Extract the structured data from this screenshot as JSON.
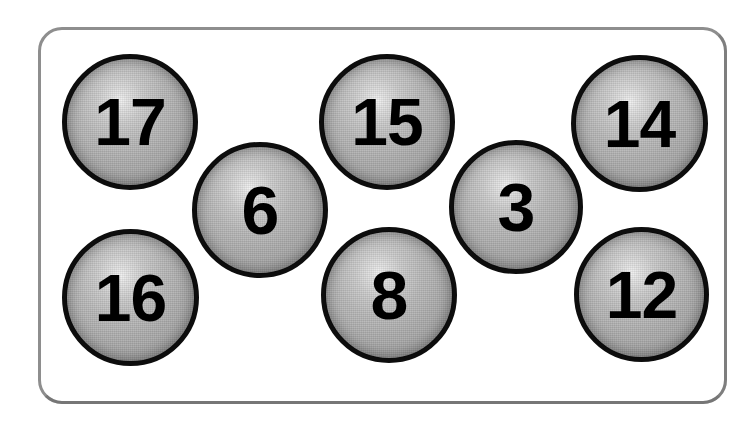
{
  "scene": {
    "width": 754,
    "height": 428,
    "background_color": "#ffffff",
    "description": "Photograph-style illustration of eight numbered lottery/bingo balls arranged inside a white rounded rectangular tray"
  },
  "tray": {
    "name": "rounded-tray",
    "border_color": "#8e8e8e",
    "fill_color": "#ffffff",
    "border_width_px": 3,
    "corner_radius_px": 24,
    "left": 38,
    "top": 27,
    "width": 683,
    "height": 371
  },
  "ball_style": {
    "outline_color": "#0d0d0d",
    "outline_width_px": 5,
    "surface_base_color": "#b2b2b2",
    "highlight_color": "#f2f2f2",
    "shadow_color": "#8c8c8c",
    "number_color": "#000000"
  },
  "balls": [
    {
      "id": "ball-17",
      "label": "17",
      "row": "top",
      "order": 1,
      "left": 62,
      "top": 54,
      "size": 136,
      "digits": 2
    },
    {
      "id": "ball-6",
      "label": "6",
      "row": "middle",
      "order": 2,
      "left": 192,
      "top": 142,
      "size": 136,
      "digits": 1
    },
    {
      "id": "ball-15",
      "label": "15",
      "row": "top",
      "order": 3,
      "left": 319,
      "top": 54,
      "size": 136,
      "digits": 2
    },
    {
      "id": "ball-3",
      "label": "3",
      "row": "middle",
      "order": 4,
      "left": 449,
      "top": 140,
      "size": 134,
      "digits": 1
    },
    {
      "id": "ball-14",
      "label": "14",
      "row": "top",
      "order": 5,
      "left": 571,
      "top": 55,
      "size": 137,
      "digits": 2
    },
    {
      "id": "ball-16",
      "label": "16",
      "row": "bottom",
      "order": 6,
      "left": 62,
      "top": 229,
      "size": 137,
      "digits": 2
    },
    {
      "id": "ball-8",
      "label": "8",
      "row": "bottom",
      "order": 7,
      "left": 321,
      "top": 227,
      "size": 136,
      "digits": 1
    },
    {
      "id": "ball-12",
      "label": "12",
      "row": "bottom",
      "order": 8,
      "left": 574,
      "top": 227,
      "size": 135,
      "digits": 2
    }
  ],
  "numbers_shown": [
    "17",
    "6",
    "15",
    "3",
    "14",
    "16",
    "8",
    "12"
  ]
}
